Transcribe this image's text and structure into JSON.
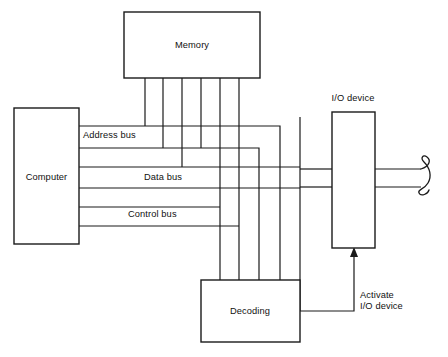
{
  "diagram": {
    "type": "block-diagram",
    "background_color": "#ffffff",
    "line_color": "#1a1a1a",
    "blocks": [
      {
        "id": "memory",
        "label": "Memory",
        "x": 124,
        "y": 12,
        "w": 136,
        "h": 66
      },
      {
        "id": "computer",
        "label": "Computer",
        "x": 14,
        "y": 108,
        "w": 65,
        "h": 136
      },
      {
        "id": "io_device",
        "label": "I/O device",
        "x": 332,
        "y": 112,
        "w": 43,
        "h": 136
      },
      {
        "id": "decoding",
        "label": "Decoding",
        "x": 201,
        "y": 280,
        "w": 99,
        "h": 62
      }
    ],
    "bus_labels": [
      {
        "id": "address_bus",
        "label": "Address bus",
        "x": 83,
        "y": 134
      },
      {
        "id": "data_bus",
        "label": "Data bus",
        "x": 144,
        "y": 175
      },
      {
        "id": "control_bus",
        "label": "Control bus",
        "x": 128,
        "y": 213
      }
    ],
    "annotations": [
      {
        "id": "io_device_caption",
        "label": "I/O device",
        "x": 353,
        "y": 98
      },
      {
        "id": "activate_signal",
        "line1": "Activate",
        "line2": "I/O device",
        "x": 360,
        "y": 294
      }
    ],
    "signal_arrow": {
      "id": "activate-io-device-arrow",
      "from_x": 354,
      "from_y": 311,
      "to_x": 354,
      "to_y": 249,
      "direction": "up"
    },
    "cable_break": {
      "id": "cable-continuation-break",
      "x": 424,
      "y_top": 162,
      "y_bottom": 195
    },
    "memory_drop_lines": [
      145,
      163,
      182,
      201,
      220,
      239
    ],
    "decoding_feed_lines": [
      220,
      239,
      259,
      280
    ]
  }
}
